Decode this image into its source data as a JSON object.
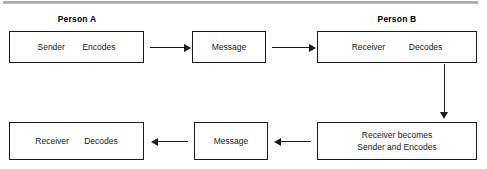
{
  "diagram": {
    "top_rule_color": "#9f9f9f",
    "line_color": "#1a1a1a",
    "box_fill": "#ffffff",
    "participants": {
      "person_a": "Person A",
      "person_b": "Person B"
    },
    "boxes": {
      "sender_encodes": {
        "role": "Sender",
        "action": "Encodes"
      },
      "message_top": {
        "label": "Message"
      },
      "receiver_decodes_top": {
        "role": "Receiver",
        "action": "Decodes"
      },
      "receiver_becomes": {
        "line1": "Receiver becomes",
        "line2": "Sender and Encodes"
      },
      "message_bottom": {
        "label": "Message"
      },
      "receiver_decodes_bottom": {
        "role": "Receiver",
        "action": "Decodes"
      }
    },
    "arrows": [
      {
        "name": "sender-to-message",
        "direction": "right"
      },
      {
        "name": "message-to-receiver",
        "direction": "right"
      },
      {
        "name": "receiver-down",
        "direction": "down"
      },
      {
        "name": "becomes-to-message",
        "direction": "left"
      },
      {
        "name": "message-to-receiver-bottom",
        "direction": "left"
      }
    ]
  }
}
